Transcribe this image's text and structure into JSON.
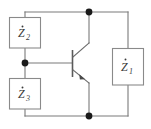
{
  "figure": {
    "kind": "circuit-schematic",
    "width": 151,
    "height": 129,
    "background_color": "#ffffff",
    "wire_color": "#7a7a7a",
    "label_color": "#3a3a3a",
    "node_color": "#1a1a1a"
  },
  "components": {
    "z1": {
      "symbol": "Z",
      "subscript": "1",
      "phasor_dot": "•",
      "full_label": "Ż1",
      "kind": "impedance-box",
      "position": "right-branch"
    },
    "z2": {
      "symbol": "Z",
      "subscript": "2",
      "phasor_dot": "•",
      "full_label": "Ż2",
      "kind": "impedance-box",
      "position": "upper-left-branch"
    },
    "z3": {
      "symbol": "Z",
      "subscript": "3",
      "phasor_dot": "•",
      "full_label": "Ż3",
      "kind": "impedance-box",
      "position": "lower-left-branch"
    },
    "transistor": {
      "kind": "npn-bipolar-transistor",
      "terminals": {
        "base": "B",
        "collector": "C",
        "emitter": "E"
      }
    }
  },
  "nodes": {
    "top": {
      "name": "top-junction",
      "x": 89,
      "y": 12
    },
    "bottom": {
      "name": "bottom-junction",
      "x": 89,
      "y": 116
    },
    "base": {
      "name": "base-junction",
      "x": 25,
      "y": 63
    }
  }
}
